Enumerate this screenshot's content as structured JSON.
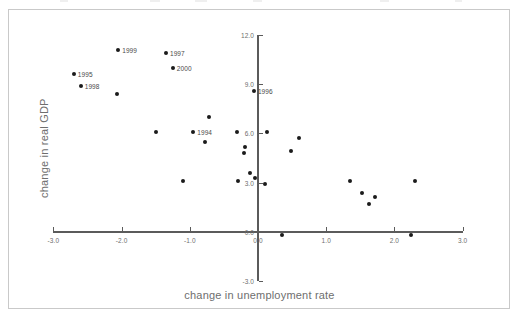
{
  "figure": {
    "background_color": "#ffffff",
    "frame_color": "#c9c9c9",
    "axis_color": "#5b5b5b",
    "point_color": "#1b1b1b",
    "label_color": "#6e6e6e"
  },
  "chart_data": {
    "type": "scatter",
    "title": "",
    "xlabel": "change in unemployment rate",
    "ylabel": "change in real GDP",
    "xlim": [
      -3.0,
      3.0
    ],
    "ylim": [
      -3.0,
      12.0
    ],
    "xticks": [
      "-3.0",
      "-2.0",
      "-1.0",
      "0.0",
      "1.0",
      "2.0",
      "3.0"
    ],
    "xtick_values": [
      -3.0,
      -2.0,
      -1.0,
      0.0,
      1.0,
      2.0,
      3.0
    ],
    "yticks": [
      "12.0",
      "9.0",
      "6.0",
      "3.0",
      "0.0",
      "-3.0"
    ],
    "ytick_values": [
      12.0,
      9.0,
      6.0,
      3.0,
      0.0,
      -3.0
    ],
    "grid": false,
    "legend": "none",
    "origin_axes": true,
    "points": [
      {
        "x": -2.05,
        "y": 11.1,
        "label": "1999"
      },
      {
        "x": -1.35,
        "y": 10.9,
        "label": "1997"
      },
      {
        "x": -1.25,
        "y": 10.0,
        "label": "2000"
      },
      {
        "x": -2.7,
        "y": 9.6,
        "label": "1995"
      },
      {
        "x": -2.6,
        "y": 8.9,
        "label": "1998"
      },
      {
        "x": -2.07,
        "y": 8.4,
        "label": ""
      },
      {
        "x": -0.06,
        "y": 8.6,
        "label": "1996"
      },
      {
        "x": -0.72,
        "y": 7.0,
        "label": ""
      },
      {
        "x": -1.5,
        "y": 6.1,
        "label": ""
      },
      {
        "x": -0.95,
        "y": 6.1,
        "label": "1994"
      },
      {
        "x": -0.31,
        "y": 6.1,
        "label": ""
      },
      {
        "x": 0.13,
        "y": 6.1,
        "label": ""
      },
      {
        "x": -0.77,
        "y": 5.5,
        "label": ""
      },
      {
        "x": 0.6,
        "y": 5.7,
        "label": ""
      },
      {
        "x": -0.19,
        "y": 5.2,
        "label": ""
      },
      {
        "x": -0.21,
        "y": 4.8,
        "label": ""
      },
      {
        "x": 0.48,
        "y": 4.9,
        "label": ""
      },
      {
        "x": -0.11,
        "y": 3.6,
        "label": ""
      },
      {
        "x": -0.05,
        "y": 3.3,
        "label": ""
      },
      {
        "x": -0.3,
        "y": 3.1,
        "label": ""
      },
      {
        "x": 0.1,
        "y": 2.9,
        "label": ""
      },
      {
        "x": 1.35,
        "y": 3.1,
        "label": ""
      },
      {
        "x": 2.3,
        "y": 3.1,
        "label": ""
      },
      {
        "x": -1.1,
        "y": 3.1,
        "label": ""
      },
      {
        "x": 1.52,
        "y": 2.4,
        "label": ""
      },
      {
        "x": 1.72,
        "y": 2.1,
        "label": ""
      },
      {
        "x": 1.63,
        "y": 1.7,
        "label": ""
      },
      {
        "x": 0.35,
        "y": -0.2,
        "label": ""
      },
      {
        "x": 2.25,
        "y": -0.2,
        "label": ""
      }
    ]
  }
}
